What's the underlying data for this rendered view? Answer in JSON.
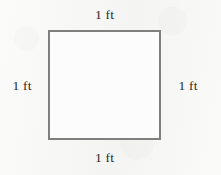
{
  "figure": {
    "type": "geometry-diagram",
    "shape": "square",
    "unit": "ft",
    "side_length_text": "1 ft",
    "stroke_color": "#7f7f80",
    "fill_color": "#fcfcfc",
    "background_color": "#f7f7f6",
    "text_color": "#2b2b2b",
    "labels": {
      "top": "1 ft",
      "right": "1 ft",
      "bottom": "1 ft",
      "left": "1 ft"
    }
  }
}
